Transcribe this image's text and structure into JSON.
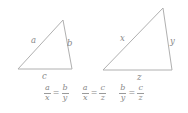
{
  "figure": {
    "kind": "similar-triangles-proportion-figure",
    "background_color": "#ffffff",
    "stroke_color": "#b0b0b0",
    "text_color": "#8a8a8a"
  },
  "triangles": [
    {
      "name": "small-triangle",
      "vertices": {
        "bottom_left": [
          18,
          69
        ],
        "apex": [
          63,
          20
        ],
        "bottom_right": [
          72,
          69
        ]
      },
      "labels": {
        "left_side": "a",
        "right_side": "b",
        "bottom_side": "c"
      },
      "label_positions": {
        "left_side": [
          31,
          36
        ],
        "right_side": [
          67,
          39
        ],
        "bottom_side": [
          42,
          72
        ]
      }
    },
    {
      "name": "large-triangle",
      "vertices": {
        "bottom_left": [
          103,
          70
        ],
        "apex": [
          163,
          8
        ],
        "bottom_right": [
          172,
          70
        ]
      },
      "labels": {
        "left_side": "x",
        "right_side": "y",
        "bottom_side": "z"
      },
      "label_positions": {
        "left_side": [
          120,
          34
        ],
        "right_side": [
          170,
          37
        ],
        "bottom_side": [
          137,
          73
        ]
      }
    }
  ],
  "equations": [
    {
      "name": "proportion-a-x-b-y",
      "left": {
        "numerator": "a",
        "denominator": "x"
      },
      "relation": "=",
      "right": {
        "numerator": "b",
        "denominator": "y"
      }
    },
    {
      "name": "proportion-a-x-c-z",
      "left": {
        "numerator": "a",
        "denominator": "x"
      },
      "relation": "=",
      "right": {
        "numerator": "c",
        "denominator": "z"
      }
    },
    {
      "name": "proportion-b-y-c-z",
      "left": {
        "numerator": "b",
        "denominator": "y"
      },
      "relation": "=",
      "right": {
        "numerator": "c",
        "denominator": "z"
      }
    }
  ]
}
